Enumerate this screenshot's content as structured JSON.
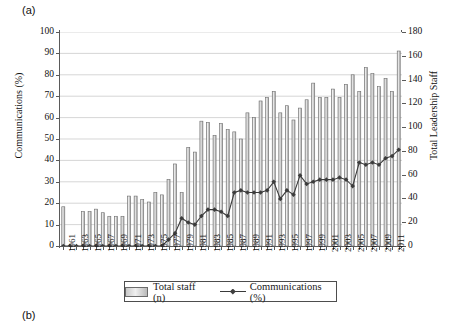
{
  "figure": {
    "panel_label": "(a)",
    "next_panel_label": "(b)"
  },
  "legend": {
    "bars_label": "Total staff (n)",
    "line_label": "Communications (%)",
    "bar_swatch_icon": "bar-swatch-icon",
    "line_marker_icon": "line-marker-icon"
  },
  "axes": {
    "left_title": "Communications (%)",
    "right_title": "Total Leadership Staff",
    "left_ticks": [
      "0",
      "10",
      "20",
      "30",
      "40",
      "50",
      "60",
      "70",
      "80",
      "90",
      "100"
    ],
    "right_ticks": [
      "0",
      "20",
      "40",
      "60",
      "80",
      "100",
      "120",
      "140",
      "160",
      "180"
    ],
    "x_tick_labels": [
      "1961",
      "1963",
      "1965",
      "1967",
      "1969",
      "1971",
      "1973",
      "1975",
      "1977",
      "1979",
      "1981",
      "1983",
      "1985",
      "1987",
      "1989",
      "1991",
      "1993",
      "1995",
      "1997",
      "1999",
      "2001",
      "2003",
      "2005",
      "2007",
      "2009",
      "2011"
    ]
  },
  "chart_data": {
    "type": "bar",
    "title": "",
    "subtitle": "",
    "xlabel": "",
    "ylabel": "Communications (%)",
    "y2label": "Total Leadership Staff",
    "ylim": [
      0,
      100
    ],
    "y2lim": [
      0,
      180
    ],
    "grid": true,
    "legend_position": "bottom",
    "categories": [
      "1961",
      "1962",
      "1963",
      "1964",
      "1965",
      "1966",
      "1967",
      "1968",
      "1969",
      "1970",
      "1971",
      "1972",
      "1973",
      "1974",
      "1975",
      "1976",
      "1977",
      "1978",
      "1979",
      "1980",
      "1981",
      "1982",
      "1983",
      "1984",
      "1985",
      "1986",
      "1987",
      "1988",
      "1989",
      "1990",
      "1991",
      "1992",
      "1993",
      "1994",
      "1995",
      "1996",
      "1997",
      "1998",
      "1999",
      "2000",
      "2001",
      "2002",
      "2003",
      "2004",
      "2005",
      "2006",
      "2007",
      "2008",
      "2009",
      "2010",
      "2011",
      "2012"
    ],
    "series": [
      {
        "name": "Total staff (n)",
        "type": "bar",
        "axis": "right",
        "unit": "n",
        "values": [
          33,
          0,
          0,
          29,
          29,
          31,
          28,
          25,
          25,
          25,
          42,
          42,
          39,
          37,
          45,
          43,
          56,
          69,
          45,
          83,
          79,
          105,
          104,
          93,
          103,
          98,
          96,
          90,
          112,
          108,
          122,
          125,
          130,
          112,
          118,
          106,
          116,
          123,
          137,
          125,
          125,
          132,
          125,
          136,
          144,
          130,
          150,
          145,
          134,
          141,
          130,
          164
        ]
      },
      {
        "name": "Communications (%)",
        "type": "line",
        "axis": "left",
        "unit": "%",
        "marker": "diamond",
        "values": [
          0,
          0,
          0,
          0,
          0,
          0,
          0,
          0,
          0,
          0,
          0,
          0,
          0,
          0,
          0,
          0,
          3,
          6,
          13,
          11,
          10,
          14,
          17,
          17,
          16,
          14,
          25,
          26,
          25,
          25,
          25,
          26,
          30,
          22,
          26,
          24,
          33,
          29,
          30,
          31,
          31,
          31,
          32,
          31,
          28,
          39,
          38,
          39,
          38,
          41,
          42,
          45
        ]
      }
    ]
  }
}
